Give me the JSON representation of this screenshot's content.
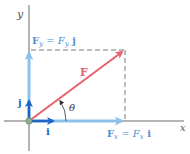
{
  "diagram": {
    "axes": {
      "x_label": "x",
      "y_label": "y",
      "axis_color": "#6b6b6b"
    },
    "vectors": {
      "F": {
        "label": "F",
        "color": "#e8616e"
      },
      "Fx": {
        "label_bold": "F",
        "label_sub": "x",
        "label_eq": " = ",
        "label_mag": "F",
        "label_mag_sub": "x",
        "label_unit": " i",
        "color": "#8ec1ea"
      },
      "Fy": {
        "label_bold": "F",
        "label_sub": "y",
        "label_eq": " = ",
        "label_mag": "F",
        "label_mag_sub": "y",
        "label_unit": " j",
        "color": "#8ec1ea"
      },
      "i": {
        "label": "i",
        "color": "#1f66c4"
      },
      "j": {
        "label": "j",
        "color": "#1f66c4"
      }
    },
    "angle": {
      "label": "θ"
    },
    "origin_color": "#8fae93",
    "dashed_color": "#7a7a7a",
    "label_color": "#4f8fcf"
  }
}
